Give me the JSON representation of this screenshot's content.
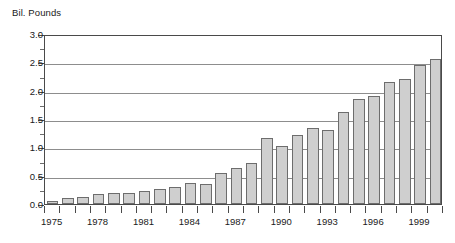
{
  "chart_data": {
    "type": "bar",
    "title": "Bil. Pounds",
    "xlabel": "",
    "ylabel": "Bil. Pounds",
    "ylim": [
      0.0,
      3.0
    ],
    "ytick_step": 0.5,
    "yminor_step": 0.25,
    "grid": true,
    "legend": "none",
    "ytick_labels": [
      "3.0",
      "2.5",
      "2.0",
      "1.5",
      "1.0",
      "0.5",
      "0.0"
    ],
    "xtick_labels": [
      "1975",
      "1978",
      "1981",
      "1984",
      "1987",
      "1990",
      "1993",
      "1996",
      "1999"
    ],
    "categories": [
      "1975",
      "1976",
      "1977",
      "1978",
      "1979",
      "1980",
      "1981",
      "1982",
      "1983",
      "1984",
      "1985",
      "1986",
      "1987",
      "1988",
      "1989",
      "1990",
      "1991",
      "1992",
      "1993",
      "1994",
      "1995",
      "1996",
      "1997",
      "1998",
      "1999",
      "2000"
    ],
    "values": [
      0.06,
      0.1,
      0.13,
      0.17,
      0.19,
      0.2,
      0.23,
      0.27,
      0.3,
      0.37,
      0.36,
      0.55,
      0.64,
      0.73,
      1.16,
      1.03,
      1.22,
      1.35,
      1.3,
      1.63,
      1.85,
      1.91,
      2.16,
      2.2,
      2.46,
      2.56
    ],
    "colors": {
      "bar_fill": "#cfcfcf",
      "bar_border": "#6d6d6d",
      "gridline": "#8d8d8d",
      "axis": "#4a4a4a",
      "text": "#1a1a1a",
      "background": "#ffffff"
    }
  }
}
